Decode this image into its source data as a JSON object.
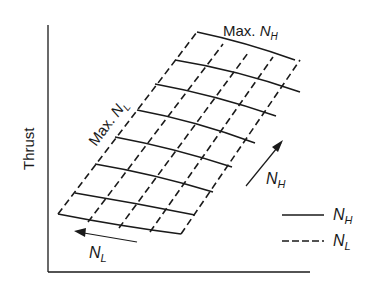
{
  "diagram": {
    "type": "engine-thrust-map",
    "y_axis_label": "Thrust",
    "x_axis_label": "",
    "annotations": {
      "max_nh": {
        "prefix": "Max. ",
        "symbol": "N",
        "subscript": "H"
      },
      "max_nl": {
        "prefix": "Max. ",
        "symbol": "N",
        "subscript": "L"
      },
      "arrow_nh": {
        "symbol": "N",
        "subscript": "H"
      },
      "arrow_nl": {
        "symbol": "N",
        "subscript": "L"
      }
    },
    "legend": [
      {
        "style": "solid",
        "symbol": "N",
        "subscript": "H"
      },
      {
        "style": "dashed",
        "symbol": "N",
        "subscript": "L"
      }
    ],
    "grid": {
      "solid_lines_constant_NH": 8,
      "dashed_lines_constant_NL": 5
    },
    "colors": {
      "ink": "#1a1a1a",
      "background": "#ffffff"
    }
  }
}
